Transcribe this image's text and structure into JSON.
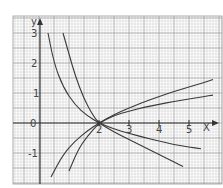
{
  "chart_data": {
    "type": "line",
    "title": "",
    "xlabel": "x",
    "ylabel": "y",
    "xlim": [
      -1.0,
      6.0
    ],
    "ylim": [
      -2.0,
      3.3
    ],
    "x_ticks": [
      "2",
      "3",
      "4",
      "5"
    ],
    "y_ticks": [
      "3",
      "2",
      "1",
      "0",
      "-1"
    ],
    "grid": true,
    "legend": "none",
    "annotations": [
      "All curves intersect at (2, 0)"
    ],
    "series": [
      {
        "name": "increasing-steep",
        "points": [
          [
            0.4,
            -1.8
          ],
          [
            0.8,
            -1.05
          ],
          [
            1.2,
            -0.6
          ],
          [
            1.6,
            -0.27
          ],
          [
            2,
            0
          ],
          [
            2.5,
            0.28
          ],
          [
            3,
            0.5
          ],
          [
            3.5,
            0.7
          ],
          [
            4,
            0.88
          ],
          [
            4.5,
            1.05
          ],
          [
            5,
            1.2
          ],
          [
            5.5,
            1.35
          ],
          [
            5.8,
            1.45
          ]
        ]
      },
      {
        "name": "increasing-shallow",
        "points": [
          [
            1.0,
            -1.6
          ],
          [
            1.3,
            -0.9
          ],
          [
            1.6,
            -0.45
          ],
          [
            2,
            0
          ],
          [
            2.5,
            0.25
          ],
          [
            3,
            0.4
          ],
          [
            3.5,
            0.52
          ],
          [
            4,
            0.62
          ],
          [
            4.5,
            0.72
          ],
          [
            5,
            0.8
          ],
          [
            5.5,
            0.88
          ],
          [
            5.8,
            0.93
          ]
        ]
      },
      {
        "name": "decreasing-steep",
        "points": [
          [
            0.3,
            3.0
          ],
          [
            0.5,
            2.0
          ],
          [
            0.8,
            1.2
          ],
          [
            1.2,
            0.6
          ],
          [
            1.6,
            0.25
          ],
          [
            2,
            0
          ],
          [
            2.5,
            -0.3
          ],
          [
            3,
            -0.55
          ],
          [
            3.5,
            -0.8
          ],
          [
            4,
            -1.05
          ],
          [
            4.5,
            -1.3
          ],
          [
            4.8,
            -1.45
          ]
        ]
      },
      {
        "name": "decreasing-shallow",
        "points": [
          [
            0.8,
            3.0
          ],
          [
            1.0,
            2.3
          ],
          [
            1.2,
            1.6
          ],
          [
            1.5,
            0.8
          ],
          [
            1.8,
            0.25
          ],
          [
            2,
            0
          ],
          [
            2.5,
            -0.2
          ],
          [
            3,
            -0.35
          ],
          [
            3.5,
            -0.48
          ],
          [
            4,
            -0.6
          ],
          [
            4.5,
            -0.72
          ],
          [
            5,
            -0.8
          ],
          [
            5.4,
            -0.86
          ]
        ]
      }
    ]
  },
  "axes": {
    "x_label": "X",
    "y_label": "y",
    "origin_label": "0",
    "x_tick_labels": [
      "2",
      "3",
      "4",
      "5"
    ],
    "y_tick_labels": [
      "3",
      "2",
      "1",
      "-1"
    ]
  },
  "colors": {
    "grid_minor": "#c8c8c8",
    "grid_major": "#9a9a9a",
    "axis": "#333333",
    "curve": "#3a3a3a",
    "background": "#ffffff"
  }
}
